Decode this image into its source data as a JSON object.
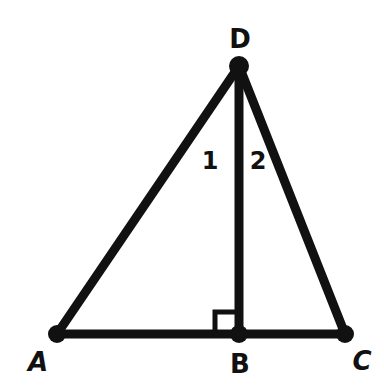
{
  "diagram": {
    "type": "geometry-triangle",
    "stroke_color": "#111111",
    "background": "#ffffff",
    "points": {
      "A": {
        "label": "A",
        "x": 57,
        "y": 334
      },
      "B": {
        "label": "B",
        "x": 239,
        "y": 334
      },
      "C": {
        "label": "C",
        "x": 345,
        "y": 334
      },
      "D": {
        "label": "D",
        "x": 239,
        "y": 66
      }
    },
    "segments": [
      "AD",
      "DC",
      "AC",
      "DB"
    ],
    "right_angle": {
      "at": "B",
      "between": [
        "AB",
        "DB"
      ]
    },
    "angle_labels": {
      "angle1": {
        "label": "1",
        "at": "D",
        "between": [
          "DA",
          "DB"
        ]
      },
      "angle2": {
        "label": "2",
        "at": "D",
        "between": [
          "DB",
          "DC"
        ]
      }
    }
  }
}
